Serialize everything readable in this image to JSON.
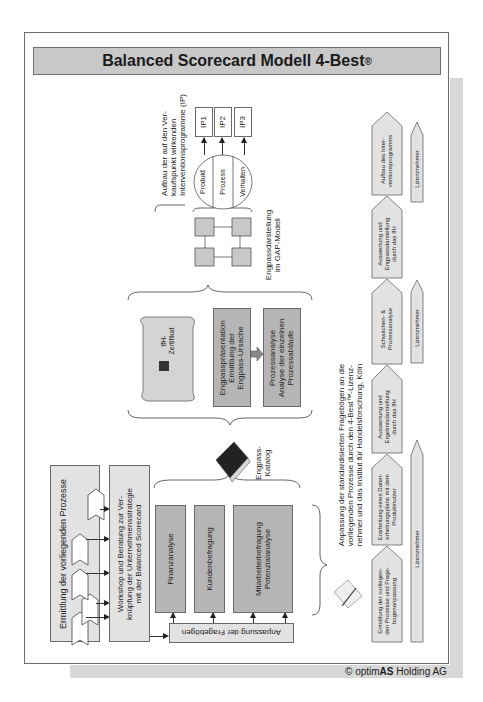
{
  "title": {
    "text": "Balanced Scorecard Modell 4-Best",
    "mark": "®"
  },
  "process": {
    "ermittlung": "Ermittlung der vorliegenden Prozesse",
    "workshop": [
      "Workshop und Beratung zur Ver-",
      "knüpfung der Unternehmensstrategie",
      "mit der Balanced Scorecard"
    ],
    "anpassung": "Anpassung der Fragebögen",
    "analyses": [
      "Finanzanalyse",
      "Kundenbefragung",
      [
        "Mitarbeiterbefragung",
        "Potenzialanalyse"
      ]
    ],
    "katalog": [
      "Engpass-",
      "Katalog"
    ],
    "zertifikat": [
      "IfH-",
      "Zertifikat"
    ],
    "engpass": [
      "Engpasspräsentation",
      "Ermittlung der",
      "Engpass-Ursache"
    ],
    "prozessanalyse": [
      "Prozessanalyse",
      "Analyse der einzelnen",
      "Prozessabläufe"
    ],
    "gap": [
      "Engpassdarstellung",
      "im GAP-Modell"
    ],
    "circle": [
      "Produkt",
      "Prozess",
      "Verhalten"
    ],
    "ip": [
      "IP1",
      "IP2",
      "IP3"
    ],
    "ip_caption": [
      "Aufbau der auf den Ver-",
      "kaufspunkt wirkenden",
      "Interventionsprogramme (IP)"
    ],
    "anpassung_note": [
      "Anpassung der standardisierten Fragebögen an die",
      "vorliegenden Prozesse durch den 4-Best™-Lizenz-",
      "nehmer und das Institut für Handelsforschung, Köln"
    ]
  },
  "timeline": {
    "steps": [
      [
        "Ermittlung der vorliegen-",
        "den Prozesse und Frage-",
        "bogenanpassung"
      ],
      [
        "Erarbeitung eines Daten-",
        "erhebungsplans mit dem",
        "Produktnutzer"
      ],
      [
        "Auswertung und",
        "Ergebnisdarstellung",
        "durch das IfH"
      ],
      [
        "Schwächen- &",
        "Prozessanalyse"
      ],
      [
        "Auswertung und",
        "Engpassdarstellung",
        "durch das IfH"
      ],
      [
        "Aufbau des Inter-",
        "ventionsprogramms"
      ]
    ],
    "lizenz_label": "Lizenznehmer"
  },
  "footer": {
    "prefix": "© optim",
    "bold": "AS",
    "suffix": " Holding AG"
  },
  "colors": {
    "light_fill": "#e2e2e2",
    "mid_fill": "#b5b5b5",
    "title_fill": "#c8c8c8",
    "border": "#6a6a6a"
  }
}
